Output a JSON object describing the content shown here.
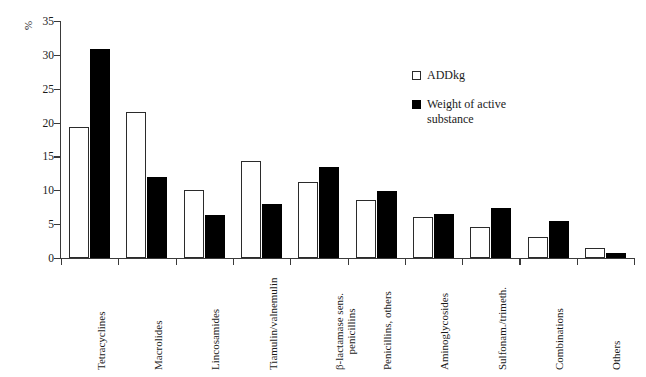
{
  "chart_data": {
    "type": "bar",
    "title": "",
    "xlabel": "",
    "ylabel": "%",
    "ylim": [
      0,
      35
    ],
    "yticks": [
      0,
      5,
      10,
      15,
      20,
      25,
      30,
      35
    ],
    "grid": false,
    "legend_position": "inside-upper-right",
    "categories": [
      "Tetracyclines",
      "Macrolides",
      "Lincosamides",
      "Tiamulin/valnemulin",
      "β-lactamase sens. penicillins",
      "Penicillins, others",
      "Aminoglycosides",
      "Sulfonam./trimeth.",
      "Combinations",
      "Others"
    ],
    "series": [
      {
        "name": "ADDkg",
        "color": "#ffffff",
        "edge_color": "#2b2b2b",
        "values": [
          19.3,
          21.6,
          10.0,
          14.4,
          11.2,
          8.5,
          6.1,
          4.6,
          3.1,
          1.5
        ]
      },
      {
        "name": "Weight of active substance",
        "color": "#000000",
        "edge_color": "#000000",
        "values": [
          30.9,
          12.0,
          6.4,
          8.0,
          13.4,
          9.9,
          6.5,
          7.4,
          5.4,
          0.8
        ]
      }
    ]
  },
  "axis": {
    "y_label": "%",
    "tick_labels": [
      "0",
      "5",
      "10",
      "15",
      "20",
      "25",
      "30",
      "35"
    ]
  },
  "legend": {
    "items": [
      {
        "label": "ADDkg",
        "swatch": "open-square"
      },
      {
        "label": "Weight of active substance",
        "swatch": "filled-square"
      }
    ]
  },
  "x_axis_labels": [
    {
      "line1": "Tetracyclines",
      "line2": ""
    },
    {
      "line1": "Macrolides",
      "line2": ""
    },
    {
      "line1": "Lincosamides",
      "line2": ""
    },
    {
      "line1": "Tiamulin/valnemulin",
      "line2": ""
    },
    {
      "line1": "β-lactamase sens.",
      "line2": "penicillins"
    },
    {
      "line1": "Penicillins, others",
      "line2": ""
    },
    {
      "line1": "Aminoglycosides",
      "line2": ""
    },
    {
      "line1": "Sulfonam./trimeth.",
      "line2": ""
    },
    {
      "line1": "Combinations",
      "line2": ""
    },
    {
      "line1": "Others",
      "line2": ""
    }
  ]
}
